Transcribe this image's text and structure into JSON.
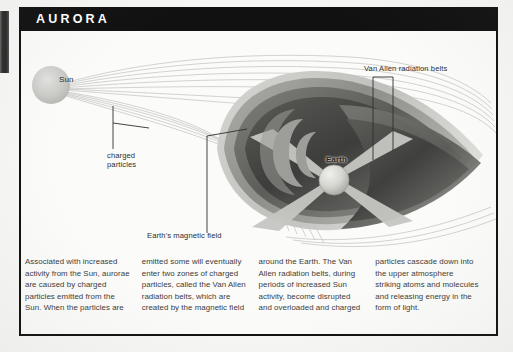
{
  "page": {
    "title": "AURORA",
    "margin_tab": "index-tab"
  },
  "figure": {
    "labels": {
      "sun": "Sun",
      "charged_particles": "charged\nparticles",
      "earth_magnetic_field": "Earth's magnetic field",
      "van_allen": "Van Allen radiation belts",
      "earth": "Earth"
    },
    "colors": {
      "banner": "#111111",
      "sun": "#c9c9c7",
      "earth": "#d8d8d4",
      "belt_dark": "#4a4a4a",
      "belt_mid": "#6f6f6f",
      "belt_light": "#9a9a9a",
      "field_line": "#b9b9b6",
      "page": "#fbfbfa"
    }
  },
  "caption": {
    "columns": [
      "Associated with increased activity from the Sun, aurorae are caused by charged particles emitted from the Sun. When the particles are",
      "emitted some will eventually enter two zones of charged particles, called the Van Allen radiation belts, which are created by the magnetic field",
      "around the Earth. The Van Allen radiation belts, during periods of increased Sun activity, become disrupted and overloaded and charged",
      "particles cascade down into the upper atmosphere striking atoms and molecules and releasing energy in the form of light."
    ]
  }
}
